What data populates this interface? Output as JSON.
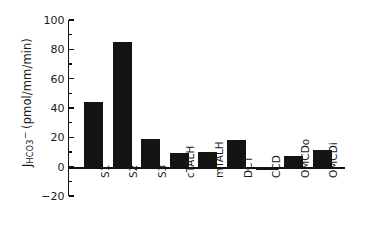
{
  "chart_data": {
    "type": "bar",
    "title": "",
    "subtitle": "",
    "xlabel": "",
    "ylabel": "J_HCO3- (pmol/mm/min)",
    "ylabel_parts": {
      "base": "J",
      "subscript": "HCO",
      "subscript_number": "3",
      "superscript": "−",
      "units": "(pmol/mm/min)"
    },
    "categories": [
      "S1",
      "S2",
      "S3",
      "cTALH",
      "mTALH",
      "DCT",
      "CCD",
      "OMCDo",
      "OMCDi"
    ],
    "values": [
      44,
      85,
      19,
      9,
      10,
      18,
      -2,
      7.5,
      11.5
    ],
    "ylim": [
      -20,
      100
    ],
    "ytick_values": [
      -20,
      0,
      20,
      40,
      60,
      80,
      100
    ],
    "ytick_labels": [
      "−20",
      "0",
      "20",
      "40",
      "60",
      "80",
      "100"
    ],
    "yminor_step": 10,
    "grid": false,
    "legend": null,
    "bar_color": "#141414",
    "axis_color": "#111111",
    "background_color": "#ffffff"
  }
}
